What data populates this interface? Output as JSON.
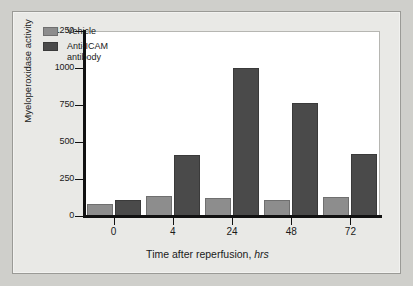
{
  "chart_data": {
    "type": "bar",
    "title": "",
    "xlabel": "Time after reperfusion, hrs",
    "xlabel_main": "Time after reperfusion,",
    "xlabel_unit": "hrs",
    "ylabel": "Myeloperoxidase activity",
    "categories": [
      "0",
      "4",
      "24",
      "48",
      "72"
    ],
    "ylim": [
      0,
      1250
    ],
    "yticks": [
      0,
      250,
      500,
      750,
      1000,
      1250
    ],
    "ytick_labels": [
      "0",
      "250",
      "500",
      "750",
      "1000",
      "1250"
    ],
    "grid": false,
    "legend_position": "top-left",
    "series": [
      {
        "name": "Vehicle",
        "color": "#8d8d8d",
        "values": [
          80,
          135,
          125,
          105,
          130
        ]
      },
      {
        "name": "Anti-ICAM antibody",
        "name_line1": "Anti-ICAM",
        "name_line2": "antibody",
        "color": "#4a4a4a",
        "values": [
          110,
          415,
          1000,
          765,
          420
        ]
      }
    ]
  },
  "legend": {
    "items": [
      {
        "label": "Vehicle",
        "label_line2": ""
      },
      {
        "label": "Anti-ICAM",
        "label_line2": "antibody"
      }
    ]
  },
  "axis": {
    "y_title": "Myeloperoxidase activity",
    "y_labels": [
      "1250",
      "1000",
      "750",
      "500",
      "250",
      "0"
    ],
    "x_labels": [
      "0",
      "4",
      "24",
      "48",
      "72"
    ]
  },
  "colors": {
    "vehicle": "#8d8d8d",
    "anti_icam": "#4a4a4a",
    "figure_background": "#e9e9e6",
    "plot_background": "#ffffff",
    "axis": "#111111"
  }
}
